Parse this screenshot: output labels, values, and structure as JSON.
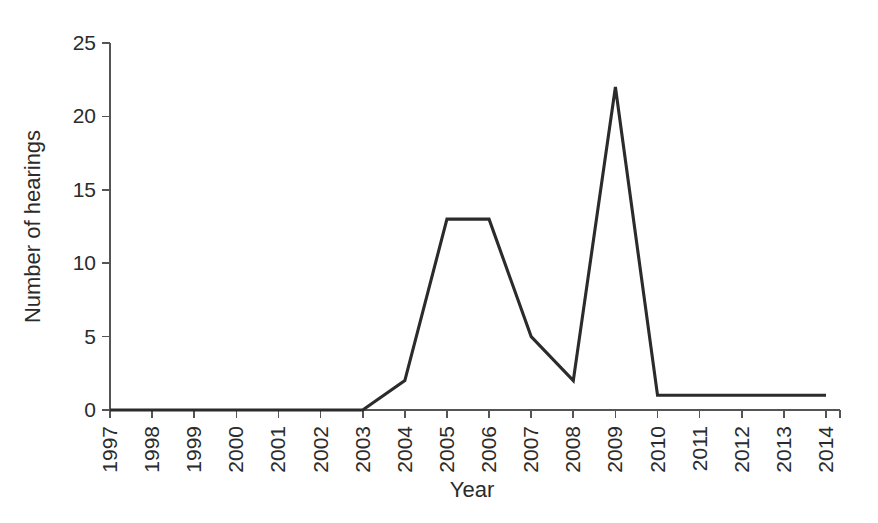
{
  "chart_data": {
    "type": "line",
    "title": "",
    "subtitle": "",
    "xlabel": "Year",
    "ylabel": "Number of hearings",
    "categories": [
      "1997",
      "1998",
      "1999",
      "2000",
      "2001",
      "2002",
      "2003",
      "2004",
      "2005",
      "2006",
      "2007",
      "2008",
      "2009",
      "2010",
      "2011",
      "2012",
      "2013",
      "2014"
    ],
    "values": [
      0,
      0,
      0,
      0,
      0,
      0,
      0,
      2,
      13,
      13,
      5,
      2,
      22,
      1,
      1,
      1,
      1,
      1
    ],
    "series": [
      {
        "name": "Number of hearings",
        "values": [
          0,
          0,
          0,
          0,
          0,
          0,
          0,
          2,
          13,
          13,
          5,
          2,
          22,
          1,
          1,
          1,
          1,
          1
        ]
      }
    ],
    "ylim": [
      0,
      25
    ],
    "yticks": [
      0,
      5,
      10,
      15,
      20,
      25
    ],
    "ytick_labels": [
      "0",
      "5",
      "10",
      "15",
      "20",
      "25"
    ],
    "xtick_labels": [
      "1997",
      "1998",
      "1999",
      "2000",
      "2001",
      "2002",
      "2003",
      "2004",
      "2005",
      "2006",
      "2007",
      "2008",
      "2009",
      "2010",
      "2011",
      "2012",
      "2013",
      "2014"
    ],
    "xtick_rotation": 90,
    "grid": false,
    "legend": false,
    "legend_position": "none",
    "line_color": "#2b2b2b",
    "axis_color": "#555555",
    "background_color": "#ffffff",
    "annotations": []
  }
}
